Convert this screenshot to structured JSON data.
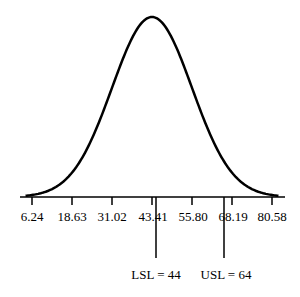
{
  "chart_data": {
    "type": "line",
    "title": "",
    "xlabel": "",
    "ylabel": "",
    "x_tick_labels": [
      "6.24",
      "18.63",
      "31.02",
      "43.41",
      "55.80",
      "68.19",
      "80.58"
    ],
    "x_ticks": [
      6.24,
      18.63,
      31.02,
      43.41,
      55.8,
      68.19,
      80.58
    ],
    "xlim": [
      3,
      85
    ],
    "distribution": {
      "mean": 43.41,
      "sd": 12.39
    },
    "grid": false,
    "legend": null,
    "annotations": [
      {
        "label": "LSL = 44",
        "x": 44
      },
      {
        "label": "USL = 64",
        "x": 64
      }
    ]
  },
  "labels": {
    "ticks": [
      "6.24",
      "18.63",
      "31.02",
      "43.41",
      "55.80",
      "68.19",
      "80.58"
    ],
    "lsl": "LSL = 44",
    "usl": "USL = 64"
  }
}
